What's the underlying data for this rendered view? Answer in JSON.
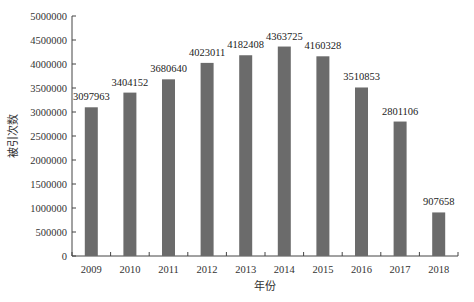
{
  "chart_data": {
    "type": "bar",
    "title": "",
    "xlabel": "年份",
    "ylabel": "被引次数",
    "categories": [
      "2009",
      "2010",
      "2011",
      "2012",
      "2013",
      "2014",
      "2015",
      "2016",
      "2017",
      "2018"
    ],
    "values": [
      3097963,
      3404152,
      3680640,
      4023011,
      4182408,
      4363725,
      4160328,
      3510853,
      2801106,
      907658
    ],
    "data_labels": [
      "3097963",
      "3404152",
      "3680640",
      "4023011",
      "4182408",
      "4363725",
      "4160328",
      "3510853",
      "2801106",
      "907658"
    ],
    "ylim": [
      0,
      5000000
    ],
    "yticks": [
      0,
      500000,
      1000000,
      1500000,
      2000000,
      2500000,
      3000000,
      3500000,
      4000000,
      4500000,
      5000000
    ],
    "ytick_labels": [
      "0",
      "500000",
      "1000000",
      "1500000",
      "2000000",
      "2500000",
      "3000000",
      "3500000",
      "4000000",
      "4500000",
      "5000000"
    ],
    "grid": false,
    "legend": null,
    "bar_color": "#6b6b6b"
  }
}
